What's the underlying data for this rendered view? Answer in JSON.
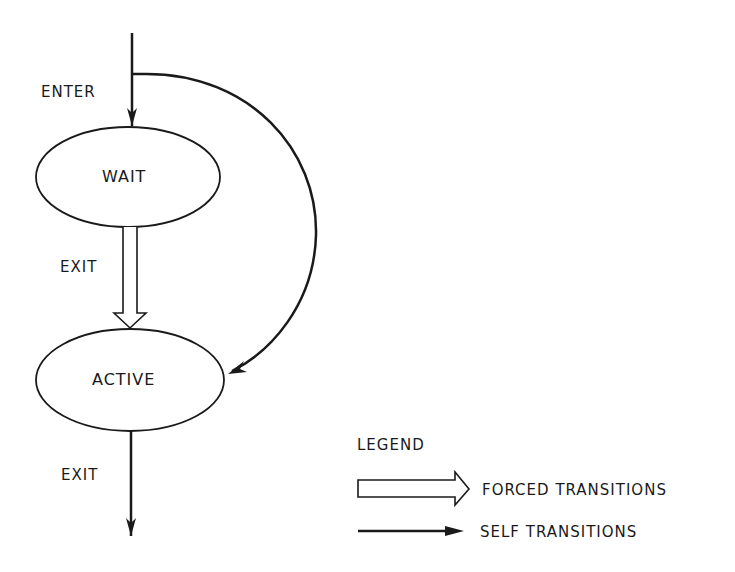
{
  "diagram": {
    "states": [
      {
        "id": "wait",
        "label": "WAIT"
      },
      {
        "id": "active",
        "label": "ACTIVE"
      }
    ],
    "transitions": [
      {
        "from": "start",
        "to": "wait",
        "label": "ENTER",
        "type": "self"
      },
      {
        "from": "wait",
        "to": "active",
        "label": "EXIT",
        "type": "forced"
      },
      {
        "from": "start",
        "to": "active",
        "label": "",
        "type": "self"
      },
      {
        "from": "active",
        "to": "end",
        "label": "EXIT",
        "type": "self"
      }
    ],
    "labels": {
      "enter": "ENTER",
      "wait_exit": "EXIT",
      "active_exit": "EXIT"
    }
  },
  "legend": {
    "title": "LEGEND",
    "items": [
      {
        "symbol": "hollow-arrow",
        "label": "FORCED TRANSITIONS"
      },
      {
        "symbol": "solid-arrow",
        "label": "SELF TRANSITIONS"
      }
    ]
  },
  "colors": {
    "stroke": "#1a1a1a",
    "background": "#ffffff"
  }
}
